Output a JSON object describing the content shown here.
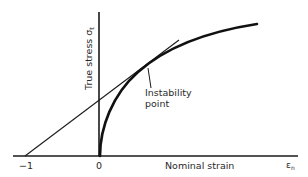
{
  "diagram": {
    "title": "",
    "y_axis_label": "True stress σ",
    "y_axis_subscript": "t",
    "x_axis_label": "Nominal strain",
    "x_axis_symbol": "ε",
    "x_axis_symbol_subscript": "n",
    "tick_minus_one": "−1",
    "tick_zero": "0",
    "annotation_line1": "Instability",
    "annotation_line2": "point",
    "colors": {
      "background": "#ffffff",
      "ink": "#1a1a1a"
    }
  }
}
